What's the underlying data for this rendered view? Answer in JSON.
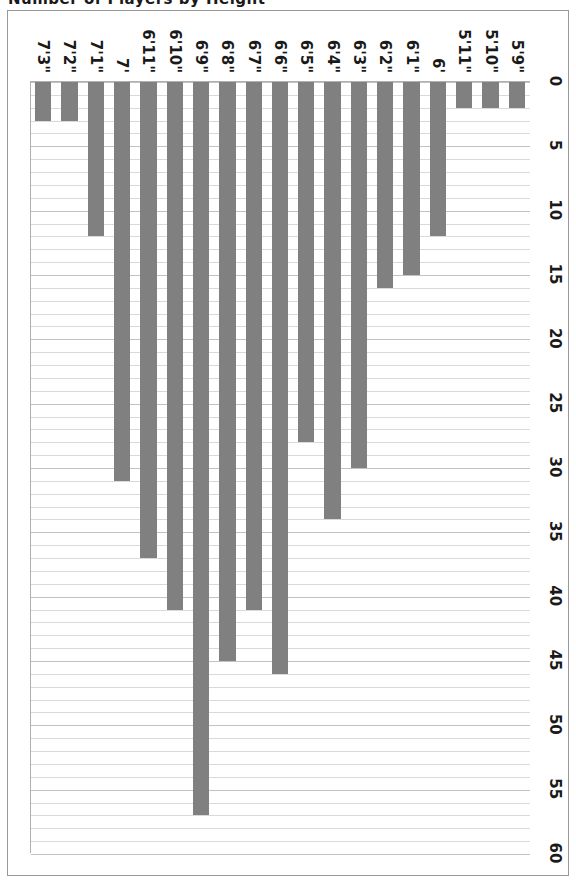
{
  "document": {
    "clipped_title": "Number of Players by Height"
  },
  "figure": {
    "frame_border_color": "#999999",
    "background": "#ffffff"
  },
  "chart_data": {
    "type": "bar",
    "orientation": "horizontal",
    "title": "",
    "xlabel": "",
    "ylabel": "",
    "xlim": [
      0,
      60
    ],
    "grid": true,
    "legend": "none",
    "bar_color": "#808080",
    "gridline_color": "#d9d9d9",
    "major_tick_step": 5,
    "minor_tick_step": 1,
    "tick_labels": [
      "0",
      "5",
      "10",
      "15",
      "20",
      "25",
      "30",
      "35",
      "40",
      "45",
      "50",
      "55",
      "60"
    ],
    "tick_values": [
      0,
      5,
      10,
      15,
      20,
      25,
      30,
      35,
      40,
      45,
      50,
      55,
      60
    ],
    "categories": [
      "5'9\"",
      "5'10\"",
      "5'11\"",
      "6'",
      "6'1\"",
      "6'2\"",
      "6'3\"",
      "6'4\"",
      "6'5\"",
      "6'6\"",
      "6'7\"",
      "6'8\"",
      "6'9\"",
      "6'10\"",
      "6'11\"",
      "7'",
      "7'1\"",
      "7'2\"",
      "7'3\""
    ],
    "values": [
      2,
      2,
      2,
      12,
      15,
      16,
      30,
      34,
      28,
      46,
      41,
      45,
      57,
      41,
      37,
      31,
      12,
      3,
      3
    ]
  }
}
